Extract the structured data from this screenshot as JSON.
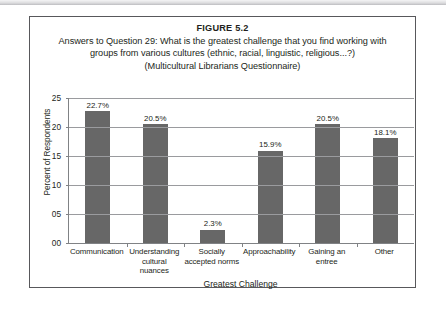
{
  "figure": {
    "number_label": "FIGURE 5.2",
    "caption_line1": "Answers to Question 29: What is the greatest challenge that you find working with",
    "caption_line2": "groups from various cultures (ethnic, racial, linguistic, religious...?)",
    "caption_line3": "(Multicultural Librarians Questionnaire)"
  },
  "colors": {
    "bar_fill": "#676767",
    "axis": "#808285",
    "gridline": "#9a9b9e",
    "panel_border": "#58585b",
    "text": "#231f20"
  },
  "chart_data": {
    "type": "bar",
    "xlabel": "Greatest Challenge",
    "ylabel": "Percent of Respondents",
    "categories": [
      "Communication",
      "Understanding cultural nuances",
      "Socially accepted norms",
      "Approachability",
      "Gaining an entree",
      "Other"
    ],
    "values": [
      22.7,
      20.5,
      2.3,
      15.9,
      20.5,
      18.1
    ],
    "data_labels": [
      "22.7%",
      "20.5%",
      "2.3%",
      "15.9%",
      "20.5%",
      "18.1%"
    ],
    "ylim": [
      0,
      25
    ],
    "ytick_values": [
      0,
      5,
      10,
      15,
      20,
      25
    ],
    "ytick_labels": [
      "00",
      "05",
      "10",
      "15",
      "20",
      "25"
    ],
    "grid": true,
    "legend": null
  }
}
